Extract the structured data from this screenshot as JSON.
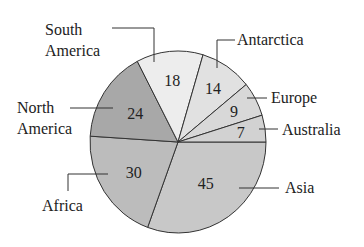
{
  "chart_data": {
    "type": "pie",
    "title": "( )",
    "total": 147,
    "start_angle_deg": 0,
    "direction": "clockwise",
    "slices": [
      {
        "name": "Asia",
        "value": 45,
        "color": "#c8c8c8"
      },
      {
        "name": "Africa",
        "value": 30,
        "color": "#bcbcbc"
      },
      {
        "name": "North America",
        "value": 24,
        "color": "#a8a8a8"
      },
      {
        "name": "South America",
        "value": 18,
        "color": "#ededed"
      },
      {
        "name": "Antarctica",
        "value": 14,
        "color": "#e1e1e1"
      },
      {
        "name": "Europe",
        "value": 9,
        "color": "#d8d8d8"
      },
      {
        "name": "Australia",
        "value": 7,
        "color": "#d2d2d2"
      }
    ],
    "labels": {
      "Asia": [
        "Asia"
      ],
      "Africa": [
        "Africa"
      ],
      "North America": [
        "North",
        "America"
      ],
      "South America": [
        "South",
        "America"
      ],
      "Antarctica": [
        "Antarctica"
      ],
      "Europe": [
        "Europe"
      ],
      "Australia": [
        "Australia"
      ]
    }
  }
}
